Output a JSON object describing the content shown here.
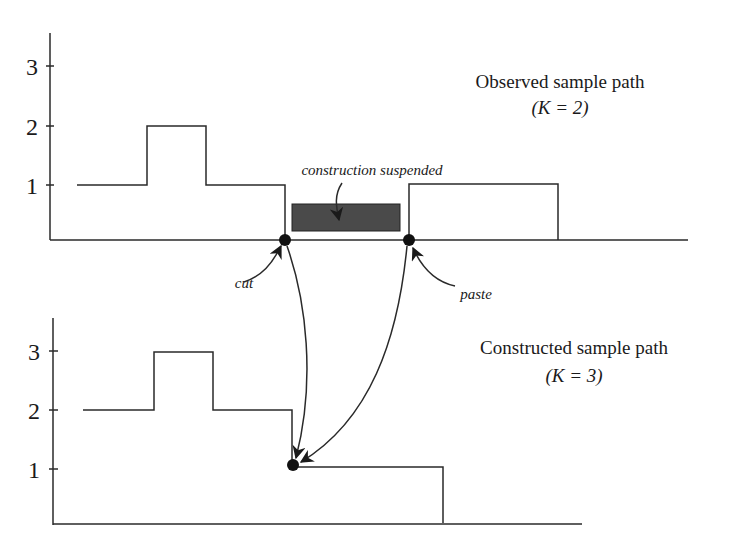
{
  "top_panel": {
    "title_line1": "Observed sample path",
    "title_line2": "(K = 2)",
    "y_ticks": [
      "1",
      "2",
      "3"
    ],
    "annotation_suspended": "construction suspended",
    "annotation_cut": "cut",
    "annotation_paste": "paste"
  },
  "bottom_panel": {
    "title_line1": "Constructed sample path",
    "title_line2": "(K = 3)",
    "y_ticks": [
      "1",
      "2",
      "3"
    ]
  },
  "colors": {
    "line": "#2a2a2a",
    "suspended_block": "#4a4a4a",
    "background": "#ffffff"
  }
}
